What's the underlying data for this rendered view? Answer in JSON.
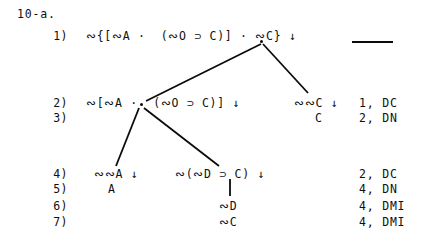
{
  "exercise": {
    "label": "10-a."
  },
  "proof": {
    "rows": [
      {
        "number": "1)",
        "left_formula": "∾{[∾A ·  (∾O ⊃ C)] · ∾C} ↓",
        "right_formula": "",
        "justification": ""
      },
      {
        "number": "2)",
        "left_formula": "∾[∾A ·  (∾O ⊃ C)] ↓",
        "right_formula": "∾∾C ↓",
        "justification": "1, DC"
      },
      {
        "number": "3)",
        "left_formula": "",
        "right_formula": "C",
        "justification": "2, DN"
      },
      {
        "number": "4)",
        "left_formula": "∾∾A ↓",
        "right_formula": "∾(∾D ⊃ C) ↓",
        "justification": "2, DC"
      },
      {
        "number": "5)",
        "left_formula": "A",
        "right_formula": "",
        "justification": "4, DN"
      },
      {
        "number": "6)",
        "left_formula": "",
        "right_formula": "∾D",
        "justification": "4, DMI"
      },
      {
        "number": "7)",
        "left_formula": "",
        "right_formula": "∾C",
        "justification": "4, DMI"
      }
    ],
    "premise_dash": "—"
  },
  "colors": {
    "ink": "#0b0b0b",
    "paper": "#ffffff"
  }
}
